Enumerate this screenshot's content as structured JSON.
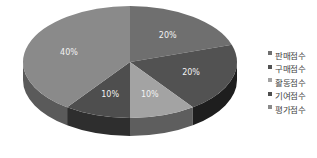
{
  "chart_data": {
    "type": "pie",
    "style": "3d",
    "title": "",
    "categories": [
      "판매점수",
      "구매점수",
      "활동점수",
      "기여점수",
      "평가점수"
    ],
    "values": [
      20,
      20,
      10,
      10,
      40
    ],
    "labels": [
      "20%",
      "20%",
      "10%",
      "10%",
      "40%"
    ],
    "colors": [
      "#6f6f6f",
      "#525252",
      "#a3a3a3",
      "#4e4e4e",
      "#8a8a8a"
    ],
    "side_colors": [
      "#4a4a4a",
      "#1e1e1e",
      "#5e5e5e",
      "#2e2e2e",
      "#5a5a5a"
    ],
    "start_angle_deg": -90,
    "direction": "clockwise",
    "legend_position": "right"
  },
  "legend": {
    "items": [
      {
        "label": "판매점수",
        "color": "#6f6f6f"
      },
      {
        "label": "구매점수",
        "color": "#525252"
      },
      {
        "label": "활동점수",
        "color": "#a3a3a3"
      },
      {
        "label": "기여점수",
        "color": "#4e4e4e"
      },
      {
        "label": "평가점수",
        "color": "#8a8a8a"
      }
    ]
  }
}
